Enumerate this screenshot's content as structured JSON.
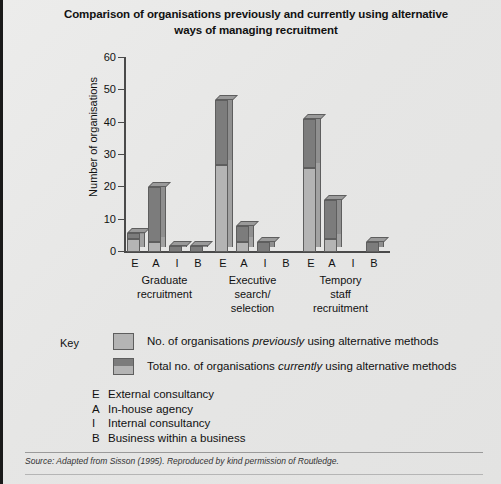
{
  "chart_data": {
    "type": "bar",
    "title": "Comparison of organisations previously and currently using alternative ways of managing recruitment",
    "title_line1": "Comparison of organisations previously and currently using alternative",
    "title_line2": "ways of managing recruitment",
    "xlabel": "",
    "ylabel": "Number of organisations",
    "ylim": [
      0,
      60
    ],
    "yticks": [
      0,
      10,
      20,
      30,
      40,
      50,
      60
    ],
    "grid": false,
    "legend_position": "below-plot",
    "categories": [
      "E",
      "A",
      "I",
      "B"
    ],
    "groups": [
      {
        "name": "Graduate recruitment",
        "name_line1": "Graduate",
        "name_line2": "recruitment",
        "name_line3": "",
        "bars": [
          {
            "category": "E",
            "previously": 4,
            "currently": 6
          },
          {
            "category": "A",
            "previously": 3,
            "currently": 20
          },
          {
            "category": "I",
            "previously": 0,
            "currently": 2
          },
          {
            "category": "B",
            "previously": 0,
            "currently": 2
          }
        ]
      },
      {
        "name": "Executive search/ selection",
        "name_line1": "Executive",
        "name_line2": "search/",
        "name_line3": "selection",
        "bars": [
          {
            "category": "E",
            "previously": 27,
            "currently": 47
          },
          {
            "category": "A",
            "previously": 3,
            "currently": 8
          },
          {
            "category": "I",
            "previously": 0,
            "currently": 3
          },
          {
            "category": "B",
            "previously": 0,
            "currently": 0
          }
        ]
      },
      {
        "name": "Tempory staff recruitment",
        "name_line1": "Tempory",
        "name_line2": "staff",
        "name_line3": "recruitment",
        "bars": [
          {
            "category": "E",
            "previously": 26,
            "currently": 41
          },
          {
            "category": "A",
            "previously": 4,
            "currently": 16
          },
          {
            "category": "I",
            "previously": 0,
            "currently": 0
          },
          {
            "category": "B",
            "previously": 0,
            "currently": 3
          }
        ]
      }
    ],
    "series": [
      {
        "name": "No. of organisations previously using alternative methods",
        "color": "#b4b4b4"
      },
      {
        "name": "Total no. of organisations currently using alternative methods",
        "color": "#7c7c7c"
      }
    ]
  },
  "key": {
    "label": "Key",
    "items": [
      {
        "swatch": "light",
        "text_before": "No. of organisations ",
        "text_emphasis": "previously",
        "text_after": " using alternative methods"
      },
      {
        "swatch": "split",
        "text_before": "Total no. of organisations ",
        "text_emphasis": "currently",
        "text_after": " using alternative methods"
      }
    ],
    "abbreviations": [
      {
        "letter": "E",
        "meaning": "External consultancy"
      },
      {
        "letter": "A",
        "meaning": "In-house agency"
      },
      {
        "letter": "I",
        "meaning": "Internal consultancy"
      },
      {
        "letter": "B",
        "meaning": "Business within a business"
      }
    ]
  },
  "source": {
    "prefix": "Source:",
    "text": " Adapted from Sisson (1995). Reproduced by kind permission of Routledge."
  },
  "colors": {
    "bar_light": "#b4b4b4",
    "bar_dark": "#7c7c7c",
    "bar_outline": "#5e5e5e",
    "background": "#e8e8e8",
    "axis": "#4a4a4a"
  }
}
